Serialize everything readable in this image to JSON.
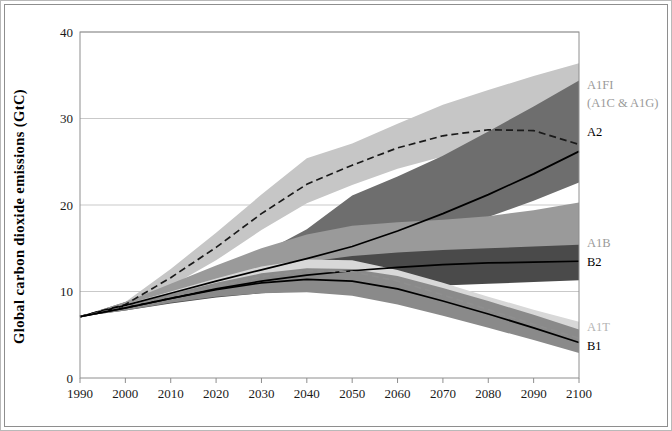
{
  "chart_data": {
    "type": "area",
    "title": "",
    "xlabel": "",
    "ylabel": "Global carbon dioxide emissions (GtC)",
    "xlim": [
      1990,
      2100
    ],
    "ylim": [
      0,
      40
    ],
    "xticks": [
      "1990",
      "2000",
      "2010",
      "2020",
      "2030",
      "2040",
      "2050",
      "2060",
      "2070",
      "2080",
      "2090",
      "2100"
    ],
    "yticks": [
      "0",
      "10",
      "20",
      "30",
      "40"
    ],
    "grid": "horizontal",
    "legend_position": "right-of-plot",
    "x": [
      1990,
      2000,
      2010,
      2020,
      2030,
      2040,
      2050,
      2060,
      2070,
      2080,
      2090,
      2100
    ],
    "series": [
      {
        "name": "A1FI",
        "label": "A1FI",
        "sublabel": "(A1C & A1G)",
        "label_color": "#9a9a9a",
        "band_color": "#c6c6c6",
        "line_style": "dashed",
        "line_color": "#1a1a1a",
        "values": [
          7.1,
          8.5,
          11.6,
          15.1,
          19.0,
          22.4,
          24.6,
          26.6,
          28.0,
          28.7,
          28.6,
          27.0
        ],
        "band_low": [
          7.1,
          8.1,
          10.6,
          13.6,
          17.1,
          20.2,
          22.3,
          24.2,
          25.6,
          26.2,
          25.6,
          23.4
        ],
        "band_high": [
          7.1,
          8.8,
          12.6,
          16.8,
          21.2,
          25.4,
          27.1,
          29.4,
          31.6,
          33.3,
          34.9,
          36.4
        ]
      },
      {
        "name": "A2",
        "label": "A2",
        "label_color": "#000000",
        "band_color": "#6e6e6e",
        "line_style": "solid",
        "line_color": "#000000",
        "values": [
          7.1,
          8.4,
          9.8,
          11.2,
          12.5,
          13.8,
          15.2,
          17.0,
          19.0,
          21.2,
          23.6,
          26.2
        ],
        "band_low": [
          7.1,
          8.0,
          9.2,
          10.4,
          11.5,
          12.6,
          13.9,
          15.3,
          16.9,
          18.6,
          20.5,
          22.6
        ],
        "band_high": [
          7.1,
          8.8,
          10.6,
          12.5,
          14.4,
          17.2,
          21.1,
          23.3,
          25.7,
          28.5,
          31.4,
          34.4
        ]
      },
      {
        "name": "A1B",
        "label": "A1B",
        "label_color": "#9a9a9a",
        "band_color": "#9a9a9a",
        "line_style": "none",
        "values": [
          7.1,
          8.4,
          9.9,
          11.3,
          12.6,
          13.6,
          14.1,
          14.5,
          14.8,
          15.0,
          15.2,
          15.4
        ],
        "band_low": [
          7.1,
          8.0,
          9.0,
          9.8,
          10.4,
          10.8,
          11.0,
          11.1,
          11.3,
          11.5,
          11.7,
          11.9
        ],
        "band_high": [
          7.1,
          8.8,
          10.9,
          13.0,
          15.0,
          16.6,
          17.6,
          18.0,
          18.3,
          18.7,
          19.4,
          20.3
        ]
      },
      {
        "name": "B2",
        "label": "B2",
        "label_color": "#000000",
        "band_color": "#4a4a4a",
        "line_style": "solid",
        "line_color": "#000000",
        "values": [
          7.1,
          8.1,
          9.2,
          10.3,
          11.2,
          11.9,
          12.4,
          12.8,
          13.1,
          13.3,
          13.4,
          13.5
        ],
        "band_low": [
          7.1,
          7.8,
          8.6,
          9.3,
          9.8,
          10.1,
          10.3,
          10.5,
          10.7,
          10.9,
          11.1,
          11.3
        ],
        "band_high": [
          7.1,
          8.4,
          9.8,
          11.2,
          12.4,
          13.4,
          14.1,
          14.5,
          14.8,
          15.0,
          15.2,
          15.4
        ]
      },
      {
        "name": "A1T",
        "label": "A1T",
        "label_color": "#b4b4b4",
        "band_color": "#d8d8d8",
        "line_style": "dashed",
        "line_color": "#8e8e8e",
        "values": [
          7.1,
          8.2,
          9.4,
          10.6,
          11.7,
          12.4,
          12.3,
          11.2,
          9.6,
          7.9,
          6.2,
          4.6
        ],
        "band_low": [
          7.1,
          7.9,
          8.8,
          9.6,
          10.2,
          10.5,
          10.2,
          9.1,
          7.7,
          6.2,
          4.8,
          3.4
        ],
        "band_high": [
          7.1,
          8.5,
          10.0,
          11.5,
          12.9,
          13.7,
          13.6,
          12.5,
          11.0,
          9.4,
          7.9,
          6.5
        ]
      },
      {
        "name": "B1",
        "label": "B1",
        "label_color": "#000000",
        "band_color": "#8a8a8a",
        "line_style": "solid",
        "line_color": "#000000",
        "values": [
          7.1,
          8.1,
          9.2,
          10.2,
          11.0,
          11.4,
          11.2,
          10.3,
          8.9,
          7.4,
          5.8,
          4.1
        ],
        "band_low": [
          7.1,
          7.8,
          8.7,
          9.4,
          9.8,
          9.9,
          9.5,
          8.5,
          7.2,
          5.8,
          4.4,
          2.9
        ],
        "band_high": [
          7.1,
          8.4,
          9.7,
          11.0,
          12.1,
          12.7,
          12.6,
          11.8,
          10.4,
          8.9,
          7.3,
          5.6
        ]
      }
    ],
    "annotations": [
      {
        "text": "A1FI",
        "at_year": 2100,
        "at_value": 35.0
      },
      {
        "text": "(A1C & A1G)",
        "at_year": 2100,
        "at_value": 33.0
      },
      {
        "text": "A2",
        "at_year": 2100,
        "at_value": 26.2
      },
      {
        "text": "A1B",
        "at_year": 2100,
        "at_value": 15.4
      },
      {
        "text": "B2",
        "at_year": 2100,
        "at_value": 13.5
      },
      {
        "text": "A1T",
        "at_year": 2100,
        "at_value": 4.6
      },
      {
        "text": "B1",
        "at_year": 2100,
        "at_value": 4.1
      }
    ]
  }
}
